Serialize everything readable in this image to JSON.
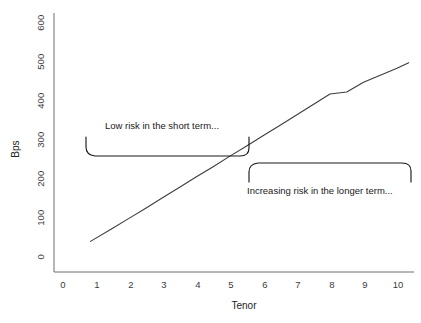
{
  "chart_data": {
    "type": "line",
    "title": "",
    "xlabel": "Tenor",
    "ylabel": "Bps",
    "xlim": [
      0,
      10.5
    ],
    "ylim": [
      0,
      620
    ],
    "xticks": [
      "0",
      "1",
      "2",
      "3",
      "4",
      "5",
      "6",
      "7",
      "8",
      "9",
      "10"
    ],
    "yticks": [
      "0",
      "100",
      "200",
      "300",
      "400",
      "500",
      "600"
    ],
    "grid": false,
    "legend": null,
    "series": [
      {
        "name": "Credit spread curve",
        "color": "#3d3d3d",
        "x": [
          0.85,
          1.5,
          2.0,
          2.5,
          3.0,
          3.5,
          4.0,
          4.5,
          5.0,
          5.5,
          6.0,
          6.5,
          7.0,
          7.5,
          8.0,
          8.5,
          9.0,
          9.5,
          10.0,
          10.35
        ],
        "y": [
          40,
          73,
          99,
          125,
          152,
          178,
          205,
          231,
          258,
          284,
          311,
          337,
          364,
          391,
          418,
          423,
          448,
          466,
          484,
          498
        ]
      }
    ],
    "annotations": [
      {
        "id": "short-term-note",
        "text": "Low risk in the short term...",
        "x_range": [
          0.85,
          5.7
        ],
        "y_value": 300,
        "bracket": "up"
      },
      {
        "id": "longer-term-note",
        "text": "Increasing risk in the longer term...",
        "x_range": [
          5.75,
          10.4
        ],
        "y_value": 245,
        "bracket": "down"
      }
    ],
    "axis_color": "#6f6f6f",
    "line_color": "#3d3d3d",
    "background": "#ffffff"
  },
  "axes": {
    "y_label": "Bps",
    "x_label": "Tenor",
    "y_tick_labels": [
      "600",
      "500",
      "400",
      "300",
      "200",
      "100",
      "0"
    ],
    "x_tick_labels": [
      "0",
      "1",
      "2",
      "3",
      "4",
      "5",
      "6",
      "7",
      "8",
      "9",
      "10"
    ]
  },
  "annotations": {
    "short_term": "Low risk in the short term...",
    "long_term": "Increasing risk in the longer term..."
  }
}
